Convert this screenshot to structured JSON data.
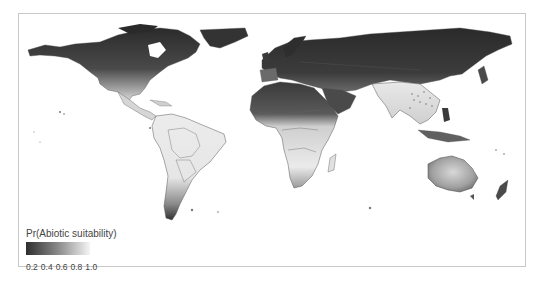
{
  "map": {
    "type": "choropleth-raster",
    "projection": "world",
    "colormap": [
      "#2a2a2a",
      "#5a5a5a",
      "#8c8c8c",
      "#c4c4c4",
      "#f4f4f4"
    ],
    "border_color": "#555555",
    "ocean_color": "#ffffff"
  },
  "legend": {
    "title": "Pr(Abiotic suitability)",
    "ticks": [
      "0.2",
      "0.4",
      "0.6",
      "0.8",
      "1.0"
    ],
    "gradient_start": "#2e2e2e",
    "gradient_end": "#f5f5f5"
  }
}
